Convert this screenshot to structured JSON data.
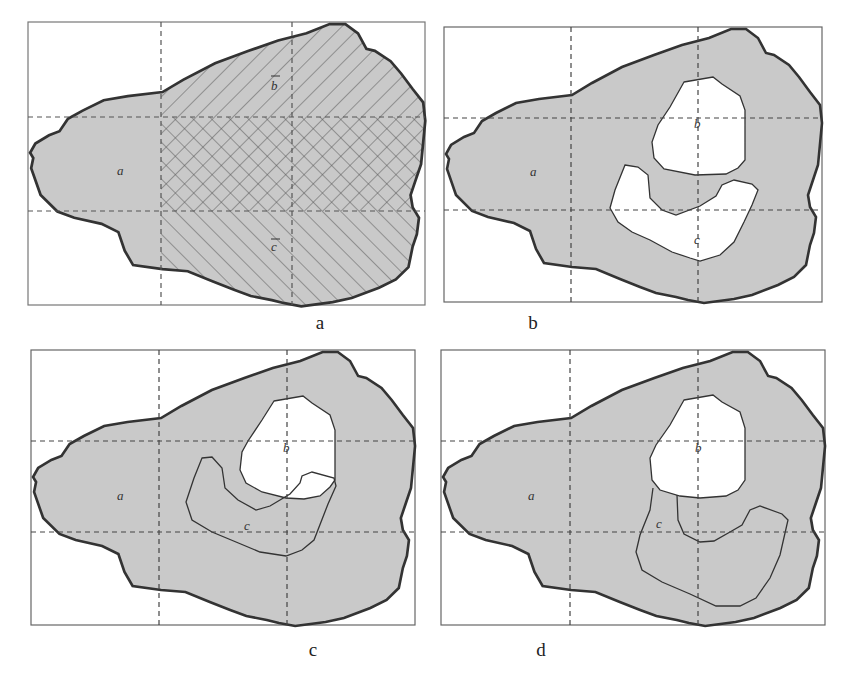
{
  "figure": {
    "panels": [
      {
        "id": "a",
        "caption": "a",
        "labels": {
          "region_a": "a",
          "not_b": "b",
          "not_c": "c"
        },
        "description": "Universe region a with hatched complement of b (diagonal /) and complement of c (diagonal \\), cross-hatched where both overlap"
      },
      {
        "id": "b",
        "caption": "b",
        "labels": {
          "region_a": "a",
          "region_b": "b",
          "region_c": "c"
        },
        "description": "Regions b and c are disjoint white holes inside shaded region a"
      },
      {
        "id": "c",
        "caption": "c",
        "labels": {
          "region_a": "a",
          "region_b": "b",
          "region_c": "c"
        },
        "description": "Region c overlaps region b; c outlined over shaded a"
      },
      {
        "id": "d",
        "caption": "d",
        "labels": {
          "region_a": "a",
          "region_b": "b",
          "region_c": "c"
        },
        "description": "Region c touches the bottom of region b; c outlined over shaded a"
      }
    ],
    "colors": {
      "fill_gray": "#c9c9c9",
      "outline": "#333333",
      "hatch": "#555555",
      "dash": "#444444",
      "hole": "#ffffff"
    }
  }
}
